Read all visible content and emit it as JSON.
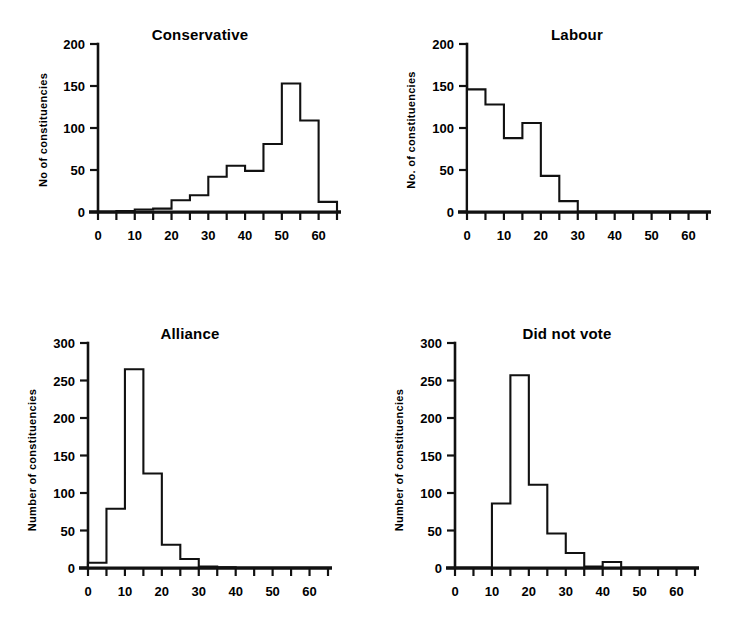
{
  "figure": {
    "background": "#ffffff",
    "ink": "#111111",
    "panel_count": 4
  },
  "chart_data": [
    {
      "type": "bar",
      "title": "Conservative",
      "xlabel": "",
      "ylabel": "No  of constituencies",
      "xlim": [
        0,
        65
      ],
      "ylim": [
        0,
        200
      ],
      "yticks": [
        0,
        50,
        100,
        150,
        200
      ],
      "ytick_labels": [
        "0",
        "50",
        "100",
        "150",
        "200"
      ],
      "xticks": [
        0,
        5,
        10,
        15,
        20,
        25,
        30,
        35,
        40,
        45,
        50,
        55,
        60,
        65
      ],
      "xtick_labels": [
        "0",
        "10",
        "20",
        "30",
        "40",
        "50",
        "60"
      ],
      "xtick_label_values": [
        0,
        10,
        20,
        30,
        40,
        50,
        60
      ],
      "bin_width": 5,
      "bin_edges": [
        0,
        5,
        10,
        15,
        20,
        25,
        30,
        35,
        40,
        45,
        50,
        55,
        60,
        65
      ],
      "categories": [
        "0-5",
        "5-10",
        "10-15",
        "15-20",
        "20-25",
        "25-30",
        "30-35",
        "35-40",
        "40-45",
        "45-50",
        "50-55",
        "55-60",
        "60-65"
      ],
      "values": [
        0,
        1,
        3,
        4,
        14,
        20,
        42,
        55,
        49,
        81,
        153,
        109,
        12
      ],
      "grid": false,
      "legend": false
    },
    {
      "type": "bar",
      "title": "Labour",
      "xlabel": "",
      "ylabel": "No. of constituencies",
      "xlim": [
        0,
        65
      ],
      "ylim": [
        0,
        200
      ],
      "yticks": [
        0,
        50,
        100,
        150,
        200
      ],
      "ytick_labels": [
        "0",
        "50",
        "100",
        "150",
        "200"
      ],
      "xticks": [
        0,
        5,
        10,
        15,
        20,
        25,
        30,
        35,
        40,
        45,
        50,
        55,
        60,
        65
      ],
      "xtick_labels": [
        "0",
        "10",
        "20",
        "30",
        "40",
        "50",
        "60"
      ],
      "xtick_label_values": [
        0,
        10,
        20,
        30,
        40,
        50,
        60
      ],
      "bin_width": 5,
      "bin_edges": [
        0,
        5,
        10,
        15,
        20,
        25,
        30,
        35,
        40,
        45,
        50,
        55,
        60,
        65
      ],
      "categories": [
        "0-5",
        "5-10",
        "10-15",
        "15-20",
        "20-25",
        "25-30",
        "30-35",
        "35-40",
        "40-45",
        "45-50",
        "50-55",
        "55-60",
        "60-65"
      ],
      "values": [
        146,
        128,
        88,
        106,
        43,
        13,
        0,
        0,
        0,
        0,
        0,
        0,
        0
      ],
      "grid": false,
      "legend": false
    },
    {
      "type": "bar",
      "title": "Alliance",
      "xlabel": "",
      "ylabel": "Number of constituencies",
      "xlim": [
        0,
        65
      ],
      "ylim": [
        0,
        300
      ],
      "yticks": [
        0,
        50,
        100,
        150,
        200,
        250,
        300
      ],
      "ytick_labels": [
        "0",
        "50",
        "100",
        "150",
        "200",
        "250",
        "300"
      ],
      "xticks": [
        0,
        5,
        10,
        15,
        20,
        25,
        30,
        35,
        40,
        45,
        50,
        55,
        60,
        65
      ],
      "xtick_labels": [
        "0",
        "10",
        "20",
        "30",
        "40",
        "50",
        "60"
      ],
      "xtick_label_values": [
        0,
        10,
        20,
        30,
        40,
        50,
        60
      ],
      "bin_width": 5,
      "bin_edges": [
        0,
        5,
        10,
        15,
        20,
        25,
        30,
        35,
        40,
        45,
        50,
        55,
        60,
        65
      ],
      "categories": [
        "0-5",
        "5-10",
        "10-15",
        "15-20",
        "20-25",
        "25-30",
        "30-35",
        "35-40",
        "40-45",
        "45-50",
        "50-55",
        "55-60",
        "60-65"
      ],
      "values": [
        7,
        79,
        265,
        126,
        31,
        12,
        2,
        1,
        0,
        0,
        0,
        0,
        0
      ],
      "grid": false,
      "legend": false
    },
    {
      "type": "bar",
      "title": "Did not vote",
      "xlabel": "",
      "ylabel": "Number of constituencies",
      "xlim": [
        0,
        65
      ],
      "ylim": [
        0,
        300
      ],
      "yticks": [
        0,
        50,
        100,
        150,
        200,
        250,
        300
      ],
      "ytick_labels": [
        "0",
        "50",
        "100",
        "150",
        "200",
        "250",
        "300"
      ],
      "xticks": [
        0,
        5,
        10,
        15,
        20,
        25,
        30,
        35,
        40,
        45,
        50,
        55,
        60,
        65
      ],
      "xtick_labels": [
        "0",
        "10",
        "20",
        "30",
        "40",
        "50",
        "60"
      ],
      "xtick_label_values": [
        0,
        10,
        20,
        30,
        40,
        50,
        60
      ],
      "bin_width": 5,
      "bin_edges": [
        0,
        5,
        10,
        15,
        20,
        25,
        30,
        35,
        40,
        45,
        50,
        55,
        60,
        65
      ],
      "categories": [
        "0-5",
        "5-10",
        "10-15",
        "15-20",
        "20-25",
        "25-30",
        "30-35",
        "35-40",
        "40-45",
        "45-50",
        "50-55",
        "55-60",
        "60-65"
      ],
      "values": [
        0,
        0,
        86,
        257,
        111,
        46,
        20,
        2,
        8,
        0,
        0,
        0,
        0
      ],
      "grid": false,
      "legend": false
    }
  ]
}
